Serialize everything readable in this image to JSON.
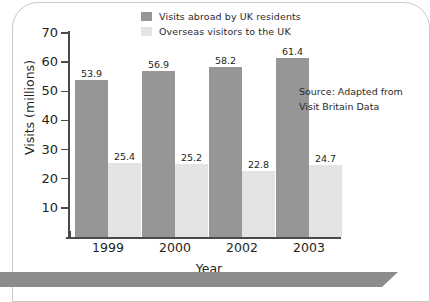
{
  "chart_data": {
    "type": "bar",
    "title": "",
    "xlabel": "Year",
    "ylabel": "Visits (millions)",
    "categories": [
      "1999",
      "2000",
      "2002",
      "2003"
    ],
    "series": [
      {
        "name": "Visits abroad by UK residents",
        "color": "#969696",
        "values": [
          53.9,
          56.9,
          58.2,
          61.4
        ]
      },
      {
        "name": "Overseas visitors to the UK",
        "color": "#e4e4e4",
        "values": [
          25.4,
          25.2,
          22.8,
          24.7
        ]
      }
    ],
    "ylim": [
      0,
      70
    ],
    "yticks": [
      10,
      20,
      30,
      40,
      50,
      60,
      70
    ],
    "grid": false,
    "legend_position": "top-center",
    "annotations": [
      "Source: Adapted from",
      "Visit Britain  Data"
    ]
  },
  "legend": {
    "items": [
      {
        "label": "Visits abroad by UK residents",
        "color": "#969696"
      },
      {
        "label": "Overseas visitors to the UK",
        "color": "#e4e4e4"
      }
    ]
  },
  "axes": {
    "y_title": "Visits (millions)",
    "x_title": "Year",
    "y_tick_labels": [
      "70",
      "60",
      "50",
      "40",
      "30",
      "20",
      "10"
    ],
    "x_tick_labels": [
      "1999",
      "2000",
      "2002",
      "2003"
    ]
  },
  "bar_value_labels": {
    "dark": [
      "53.9",
      "56.9",
      "58.2",
      "61.4"
    ],
    "light": [
      "25.4",
      "25.2",
      "22.8",
      "24.7"
    ]
  },
  "source": {
    "line1": "Source: Adapted from",
    "line2": "Visit Britain  Data"
  },
  "colors": {
    "series_dark": "#969696",
    "series_light": "#e4e4e4",
    "axis": "#4a4a4a",
    "band": "#8c8c8c",
    "text": "#231f20"
  }
}
